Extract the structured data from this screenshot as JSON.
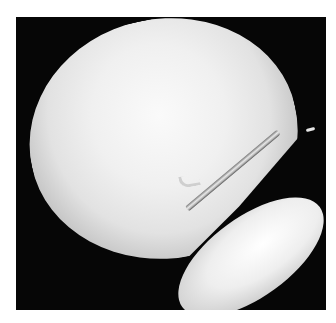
{
  "image": {
    "description": "Grayscale arthroscopic view: a large bright rounded bony surface in the upper left, a thin metal probe with a hooked tip entering from the upper right, and a second bright elliptical bony surface in the lower right, all against a black background inside a white border.",
    "colors": {
      "background": "#ffffff",
      "frame": "#060606",
      "bone_highlight": "#fafafa",
      "probe": "#cfcfcf"
    }
  }
}
